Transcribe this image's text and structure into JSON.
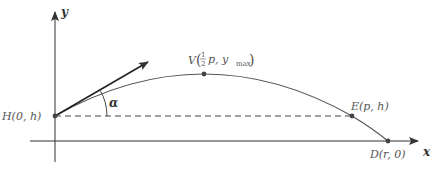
{
  "diagram": {
    "axes": {
      "x_label": "x",
      "y_label": "y"
    },
    "points": {
      "H": {
        "label": "H(0, h)"
      },
      "V": {
        "label_prefix": "V",
        "frac_num": "1",
        "frac_den": "2",
        "label_rest": "p, y",
        "sub": "max"
      },
      "E": {
        "label": "E(p, h)"
      },
      "D": {
        "label": "D(r, 0)"
      }
    },
    "angle_label": "α",
    "colors": {
      "curve": "#555555",
      "axes": "#333333",
      "points": "#444444"
    }
  }
}
